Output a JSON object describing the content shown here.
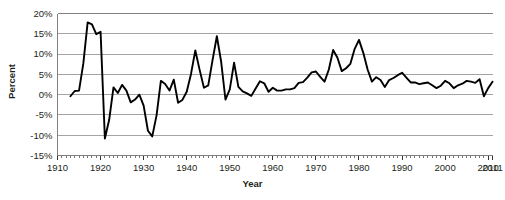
{
  "chart_data": {
    "type": "line",
    "title": "",
    "xlabel": "Year",
    "ylabel": "Percent",
    "xlim": [
      1910,
      2011
    ],
    "ylim": [
      -15,
      20
    ],
    "grid": true,
    "legend": null,
    "y_tick_labels": [
      "20%",
      "15%",
      "10%",
      "5%",
      "0%",
      "-5%",
      "-10%",
      "-15%"
    ],
    "y_tick_values": [
      20,
      15,
      10,
      5,
      0,
      -5,
      -10,
      -15
    ],
    "x_tick_labels": [
      "1910",
      "1920",
      "1930",
      "1940",
      "1950",
      "1960",
      "1970",
      "1980",
      "1990",
      "2000",
      "2010",
      "2011"
    ],
    "x_tick_values": [
      1910,
      1920,
      1930,
      1940,
      1950,
      1960,
      1970,
      1980,
      1990,
      2000,
      2010,
      2011
    ],
    "x_minor_tick_step": 1,
    "series": [
      {
        "name": "Inflation rate",
        "color": "#000000",
        "x": [
          1913,
          1914,
          1915,
          1916,
          1917,
          1918,
          1919,
          1920,
          1921,
          1922,
          1923,
          1924,
          1925,
          1926,
          1927,
          1928,
          1929,
          1930,
          1931,
          1932,
          1933,
          1934,
          1935,
          1936,
          1937,
          1938,
          1939,
          1940,
          1941,
          1942,
          1943,
          1944,
          1945,
          1946,
          1947,
          1948,
          1949,
          1950,
          1951,
          1952,
          1953,
          1954,
          1955,
          1956,
          1957,
          1958,
          1959,
          1960,
          1961,
          1962,
          1963,
          1964,
          1965,
          1966,
          1967,
          1968,
          1969,
          1970,
          1971,
          1972,
          1973,
          1974,
          1975,
          1976,
          1977,
          1978,
          1979,
          1980,
          1981,
          1982,
          1983,
          1984,
          1985,
          1986,
          1987,
          1988,
          1989,
          1990,
          1991,
          1992,
          1993,
          1994,
          1995,
          1996,
          1997,
          1998,
          1999,
          2000,
          2001,
          2002,
          2003,
          2004,
          2005,
          2006,
          2007,
          2008,
          2009,
          2010,
          2011
        ],
        "values": [
          -0.4,
          0.9,
          1.0,
          7.7,
          17.8,
          17.3,
          14.9,
          15.5,
          -10.8,
          -6.2,
          1.8,
          0.4,
          2.4,
          1.0,
          -1.9,
          -1.2,
          0.0,
          -2.7,
          -8.9,
          -10.3,
          -5.1,
          3.4,
          2.6,
          1.0,
          3.7,
          -2.0,
          -1.3,
          0.7,
          5.1,
          10.9,
          6.1,
          1.7,
          2.3,
          8.5,
          14.4,
          8.1,
          -1.2,
          1.3,
          7.9,
          1.9,
          0.8,
          0.3,
          -0.3,
          1.5,
          3.3,
          2.8,
          0.7,
          1.7,
          1.0,
          1.0,
          1.3,
          1.3,
          1.6,
          2.9,
          3.1,
          4.2,
          5.5,
          5.7,
          4.4,
          3.2,
          6.2,
          11.0,
          9.1,
          5.8,
          6.5,
          7.6,
          11.3,
          13.5,
          10.3,
          6.2,
          3.2,
          4.3,
          3.6,
          1.9,
          3.6,
          4.1,
          4.8,
          5.4,
          4.2,
          3.0,
          3.0,
          2.6,
          2.8,
          3.0,
          2.3,
          1.6,
          2.2,
          3.4,
          2.8,
          1.6,
          2.3,
          2.7,
          3.4,
          3.2,
          2.9,
          3.8,
          -0.4,
          1.6,
          3.2
        ]
      }
    ],
    "annotations": []
  }
}
